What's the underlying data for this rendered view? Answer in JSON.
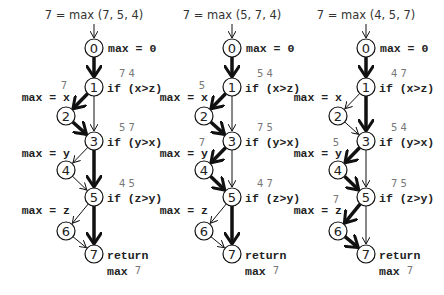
{
  "panels": [
    {
      "title": "7 = max (7, 5, 4)",
      "init": "max = 0",
      "cond1": "if (x>z)",
      "cond1_vals": "7 4",
      "assign_x": "max = x",
      "assign_x_val": "7",
      "cond2": "if (y>x)",
      "cond2_vals": "5 7",
      "assign_y": "max = y",
      "assign_y_val": "",
      "cond3": "if (z>y)",
      "cond3_vals": "4 5",
      "assign_z": "max = z",
      "assign_z_val": "",
      "ret": "return",
      "ret_max": "max",
      "ret_val": "7",
      "path": [
        "0-1",
        "1-2",
        "2-3",
        "3-5",
        "5-7"
      ]
    },
    {
      "title": "7 = max (5, 7, 4)",
      "init": "max = 0",
      "cond1": "if (x>z)",
      "cond1_vals": "5 4",
      "assign_x": "max = x",
      "assign_x_val": "5",
      "cond2": "if (y>x)",
      "cond2_vals": "7 5",
      "assign_y": "max = y",
      "assign_y_val": "7",
      "cond3": "if (z>y)",
      "cond3_vals": "4 7",
      "assign_z": "max = z",
      "assign_z_val": "",
      "ret": "return",
      "ret_max": "max",
      "ret_val": "7",
      "path": [
        "0-1",
        "1-2",
        "2-3",
        "3-4",
        "4-5",
        "5-7"
      ]
    },
    {
      "title": "7 = max (4, 5, 7)",
      "init": "max = 0",
      "cond1": "if (x>z)",
      "cond1_vals": "4 7",
      "assign_x": "max = x",
      "assign_x_val": "",
      "cond2": "if (y>x)",
      "cond2_vals": "5 4",
      "assign_y": "max = y",
      "assign_y_val": "5",
      "cond3": "if (z>y)",
      "cond3_vals": "7 5",
      "assign_z": "max = z",
      "assign_z_val": "7",
      "ret": "return",
      "ret_max": "max",
      "ret_val": "7",
      "path": [
        "0-1",
        "1-3",
        "3-4",
        "4-5",
        "5-6",
        "6-7"
      ]
    }
  ],
  "nodes": [
    "0",
    "1",
    "2",
    "3",
    "4",
    "5",
    "6",
    "7"
  ],
  "colors": {
    "stroke": "#111111",
    "value_text": "#777777",
    "text": "#222222"
  }
}
